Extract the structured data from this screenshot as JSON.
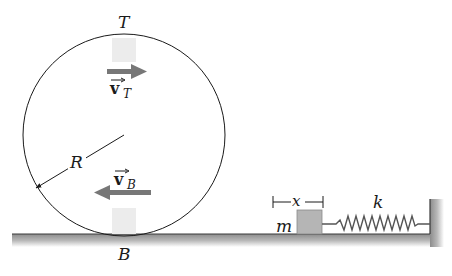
{
  "figure": {
    "labels": {
      "top_point": "T",
      "bottom_point": "B",
      "radius": "R",
      "velocity_symbol": "v",
      "velocity_top_subscript": "T",
      "velocity_bottom_subscript": "B",
      "mass": "m",
      "displacement": "x",
      "spring_constant": "k"
    },
    "colors": {
      "line": "#1a1a1a",
      "arrow_gray": "#777777",
      "ground_fill": "#9a9a9a",
      "block_fill": "#b5b5b5",
      "marker_fill": "#ececec"
    },
    "elements": {
      "wheel": "circle of radius R rolling on ground",
      "velocity_top_direction": "right",
      "velocity_bottom_direction": "left",
      "spring": "spring of constant k attached between block m and wall",
      "block_displacement": "x"
    }
  }
}
